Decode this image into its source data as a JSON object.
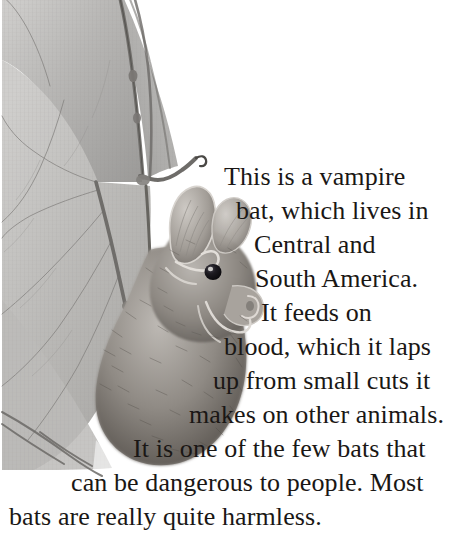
{
  "page": {
    "background_color": "#ffffff",
    "text_color": "#1a1715",
    "width": 469,
    "height": 556
  },
  "illustration": {
    "subject": "vampire-bat",
    "description": "Pencil / graphite style illustration of a vampire bat with an outstretched translucent wing membrane, visible finger bones and veins, furry body, large pointed ears, dark eye and a prominent nose-leaf.",
    "palette": {
      "membrane_light": "#c9c8c6",
      "membrane_mid": "#a8a7a5",
      "membrane_dark": "#8b8a88",
      "bone": "#6f6d6b",
      "fur_light": "#b5b1ac",
      "fur_mid": "#8a857f",
      "fur_dark": "#5a5550",
      "eye": "#17151a"
    }
  },
  "caption": {
    "full_text": "This is a vampire bat, which lives in Central and South America. It feeds on blood, which it laps up from small cuts it makes on other animals. It is one of the few bats that can be dangerous to people. Most bats are really quite harmless.",
    "lines": [
      "This is a vampire",
      "bat, which lives in",
      "Central and",
      "South America.",
      "It feeds on",
      "blood, which it laps",
      "up from small cuts it",
      "makes on other animals.",
      "It is one of the few bats that",
      "can be dangerous to people. Most",
      "bats are really quite harmless."
    ]
  }
}
